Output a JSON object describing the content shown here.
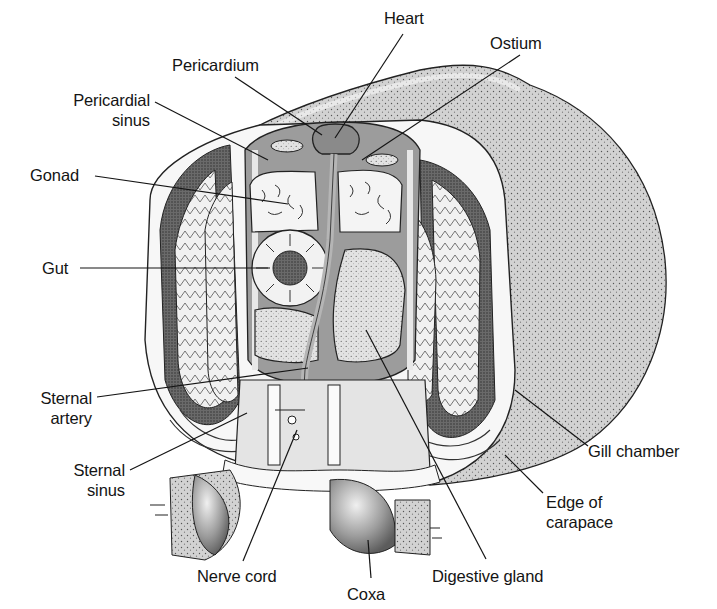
{
  "diagram": {
    "colors": {
      "background": "#ffffff",
      "ink": "#141414",
      "carapace_fill": "#cfcfcf",
      "dark_tissue": "#5a5a5a",
      "mid_tissue": "#9a9a9a",
      "light_tissue": "#e4e4e4",
      "gonad_fill": "#f4f4f4"
    },
    "labels": [
      {
        "id": "heart",
        "lines": [
          "Heart"
        ],
        "x": 384,
        "y": 8,
        "align": "left",
        "target": [
          335,
          138
        ],
        "anchor": [
          403,
          34
        ]
      },
      {
        "id": "ostium",
        "lines": [
          "Ostium"
        ],
        "x": 490,
        "y": 33,
        "align": "left",
        "target": [
          362,
          160
        ],
        "anchor": [
          520,
          55
        ]
      },
      {
        "id": "pericardium",
        "lines": [
          "Pericardium"
        ],
        "x": 172,
        "y": 55,
        "align": "left",
        "target": [
          322,
          135
        ],
        "anchor": [
          235,
          77
        ]
      },
      {
        "id": "pericardial-sinus",
        "lines": [
          "Pericardial",
          "sinus"
        ],
        "x": 30,
        "y": 90,
        "w": 120,
        "align": "right",
        "target": [
          268,
          160
        ],
        "anchor": [
          155,
          102
        ]
      },
      {
        "id": "gonad",
        "lines": [
          "Gonad"
        ],
        "x": 30,
        "y": 165,
        "align": "left",
        "target": [
          288,
          204
        ],
        "anchor": [
          95,
          176
        ]
      },
      {
        "id": "gut",
        "lines": [
          "Gut"
        ],
        "x": 42,
        "y": 258,
        "align": "left",
        "target": [
          270,
          268
        ],
        "anchor": [
          80,
          268
        ]
      },
      {
        "id": "sternal-artery",
        "lines": [
          "Sternal",
          "artery"
        ],
        "x": 10,
        "y": 388,
        "w": 82,
        "align": "right",
        "target": [
          308,
          368
        ],
        "anchor": [
          97,
          397
        ]
      },
      {
        "id": "sternal-sinus",
        "lines": [
          "Sternal",
          "sinus"
        ],
        "x": 40,
        "y": 460,
        "w": 85,
        "align": "right",
        "target": [
          247,
          413
        ],
        "anchor": [
          130,
          470
        ]
      },
      {
        "id": "nerve-cord",
        "lines": [
          "Nerve cord"
        ],
        "x": 197,
        "y": 566,
        "align": "left",
        "target": [
          297,
          430
        ],
        "anchor": [
          243,
          561
        ]
      },
      {
        "id": "coxa",
        "lines": [
          "Coxa"
        ],
        "x": 347,
        "y": 584,
        "align": "left",
        "target": [
          368,
          540
        ],
        "anchor": [
          371,
          578
        ]
      },
      {
        "id": "digestive-gland",
        "lines": [
          "Digestive gland"
        ],
        "x": 432,
        "y": 566,
        "align": "left",
        "target": [
          366,
          330
        ],
        "anchor": [
          486,
          559
        ]
      },
      {
        "id": "gill-chamber",
        "lines": [
          "Gill chamber"
        ],
        "x": 588,
        "y": 441,
        "align": "left",
        "target": [
          515,
          390
        ],
        "anchor": [
          588,
          446
        ]
      },
      {
        "id": "edge-of-carapace",
        "lines": [
          "Edge of",
          "carapace"
        ],
        "x": 546,
        "y": 492,
        "align": "left",
        "target": [
          505,
          455
        ],
        "anchor": [
          543,
          493
        ]
      }
    ]
  }
}
